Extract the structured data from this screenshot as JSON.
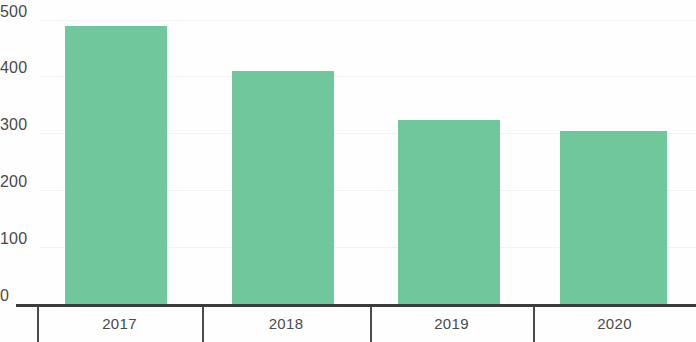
{
  "chart_data": {
    "type": "bar",
    "title": "",
    "subtitle": "",
    "xlabel": "",
    "ylabel": "",
    "categories": [
      "2017",
      "2018",
      "2019",
      "2020"
    ],
    "values": [
      490,
      410,
      325,
      305
    ],
    "series": [
      {
        "name": "",
        "values": [
          490,
          410,
          325,
          305
        ]
      }
    ],
    "ylim": [
      0,
      500
    ],
    "ytick_labels": [
      "0",
      "100",
      "200",
      "300",
      "400",
      "500"
    ],
    "ytick_values": [
      0,
      100,
      200,
      300,
      400,
      500
    ],
    "grid": true,
    "legend": false,
    "legend_position": "none",
    "bar_color": "#71c79c",
    "axis_color": "#3c3c3c",
    "label_color": "#4a4a4a",
    "background_color": "#ffffff"
  }
}
